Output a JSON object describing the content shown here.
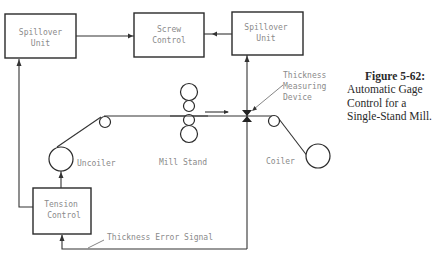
{
  "figure": {
    "number_label": "Figure 5-62:",
    "caption_lines": [
      "Automatic Gage",
      "Control for a",
      "Single-Stand Mill."
    ]
  },
  "blocks": {
    "spillover_left": {
      "line1": "Spillover",
      "line2": "Unit"
    },
    "screw_control": {
      "line1": "Screw",
      "line2": "Control"
    },
    "spillover_right": {
      "line1": "Spillover",
      "line2": "Unit"
    },
    "tension_control": {
      "line1": "Tension",
      "line2": "Control"
    }
  },
  "labels": {
    "uncoiler": "Uncoiler",
    "mill_stand": "Mill Stand",
    "coiler": "Coiler",
    "thickness_device": [
      "Thickness",
      "Measuring",
      "Device"
    ],
    "error_signal": "Thickness Error Signal"
  },
  "colors": {
    "line": "#333333",
    "label_text": "#8a8a8a",
    "caption_text": "#2a2a2a",
    "background": "#ffffff"
  }
}
